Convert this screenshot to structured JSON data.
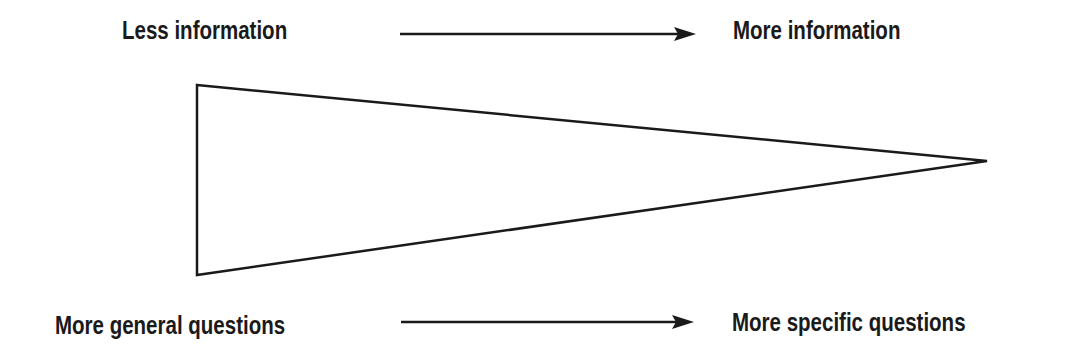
{
  "diagram": {
    "top": {
      "left_label": "Less information",
      "right_label": "More information"
    },
    "bottom": {
      "left_label": "More general questions",
      "right_label": "More specific questions"
    },
    "shape": "funnel-triangle pointing right",
    "colors": {
      "stroke": "#1a1a1a",
      "background": "#ffffff"
    }
  }
}
